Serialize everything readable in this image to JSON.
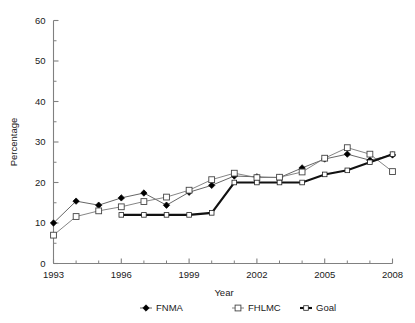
{
  "chart_data": {
    "type": "line",
    "title": "",
    "xlabel": "Year",
    "ylabel": "Percentage",
    "xlim": [
      1993,
      2008
    ],
    "ylim": [
      0,
      60
    ],
    "ytick_step": 10,
    "yticks": [
      0,
      10,
      20,
      30,
      40,
      50,
      60
    ],
    "yticklabels": [
      "0",
      "10",
      "20",
      "30",
      "40",
      "50",
      "60"
    ],
    "yminor_step": 5,
    "xticks": [
      1993,
      1994,
      1995,
      1996,
      1997,
      1998,
      1999,
      2000,
      2001,
      2002,
      2003,
      2004,
      2005,
      2006,
      2007,
      2008
    ],
    "xticklabels_shown": [
      "1993",
      "1996",
      "1999",
      "2002",
      "2005",
      "2008"
    ],
    "xticklabel_years": [
      1993,
      1996,
      1999,
      2002,
      2005,
      2008
    ],
    "grid": false,
    "legend_position": "bottom",
    "x": [
      1993,
      1994,
      1995,
      1996,
      1997,
      1998,
      1999,
      2000,
      2001,
      2002,
      2003,
      2004,
      2005,
      2006,
      2007,
      2008
    ],
    "series": [
      {
        "name": "FNMA",
        "marker": "filled-diamond",
        "color": "#000000",
        "values": [
          10.0,
          15.4,
          14.4,
          16.2,
          17.4,
          14.4,
          17.6,
          19.3,
          21.6,
          21.4,
          21.2,
          23.6,
          25.8,
          27.0,
          25.5,
          26.8
        ]
      },
      {
        "name": "FHLMC",
        "marker": "open-square",
        "color": "#ffffff",
        "values": [
          7.0,
          11.6,
          13.0,
          14.0,
          15.3,
          16.4,
          18.1,
          20.7,
          22.3,
          21.2,
          21.3,
          22.6,
          26.0,
          28.6,
          27.0,
          22.7
        ]
      },
      {
        "name": "Goal",
        "marker": "open-square-small",
        "color": "#111111",
        "values": [
          null,
          null,
          null,
          12.0,
          12.0,
          12.0,
          12.0,
          12.5,
          20.0,
          20.0,
          20.0,
          20.0,
          22.0,
          23.0,
          25.0,
          27.0
        ]
      }
    ],
    "legend": [
      {
        "label": "FNMA",
        "marker": "filled-diamond"
      },
      {
        "label": "FHLMC",
        "marker": "open-square"
      },
      {
        "label": "Goal",
        "marker": "line-square"
      }
    ]
  }
}
